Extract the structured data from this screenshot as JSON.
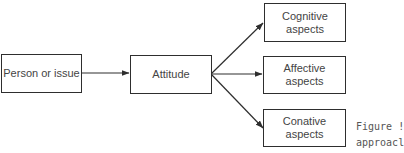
{
  "diagram": {
    "source": {
      "label": "Person or issue"
    },
    "center": {
      "label": "Attitude"
    },
    "outputs": [
      {
        "label": "Cognitive aspects",
        "line1": "Cognitive",
        "line2": "aspects"
      },
      {
        "label": "Affective aspects"
      },
      {
        "label": "Conative aspects"
      }
    ],
    "edges": [
      {
        "from": "Person or issue",
        "to": "Attitude"
      },
      {
        "from": "Attitude",
        "to": "Cognitive aspects"
      },
      {
        "from": "Attitude",
        "to": "Affective aspects"
      },
      {
        "from": "Attitude",
        "to": "Conative aspects"
      }
    ],
    "line_color": "#2e2e2e",
    "text_color": "#444444"
  },
  "caption": {
    "line1": "Figure !",
    "line2": "approacl"
  }
}
